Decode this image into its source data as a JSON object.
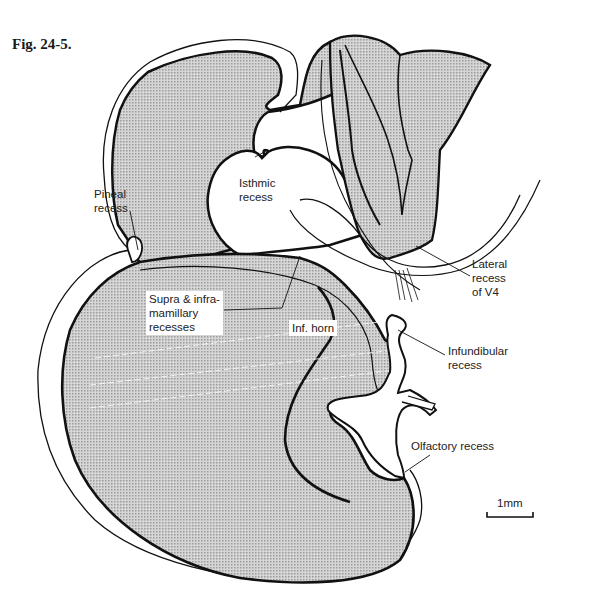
{
  "figure": {
    "title": "Fig. 24-5.",
    "corner_text": "·  ·"
  },
  "labels": {
    "pineal_recess": "Pineal\nrecess",
    "isthmic_recess": "Isthmic\nrecess",
    "lateral_recess_v4": "Lateral\nrecess\nof V4",
    "supra_infra_mamillary": "Supra & infra-\nmamillary\nrecesses",
    "inf_horn": "Inf. horn",
    "infundibular_recess": "Infundibular\nrecess",
    "olfactory_recess": "Olfactory recess"
  },
  "scale_bar": {
    "label": "1mm"
  },
  "colors": {
    "fill": "#c8c8c8",
    "stroke": "#111111",
    "background": "#ffffff"
  }
}
